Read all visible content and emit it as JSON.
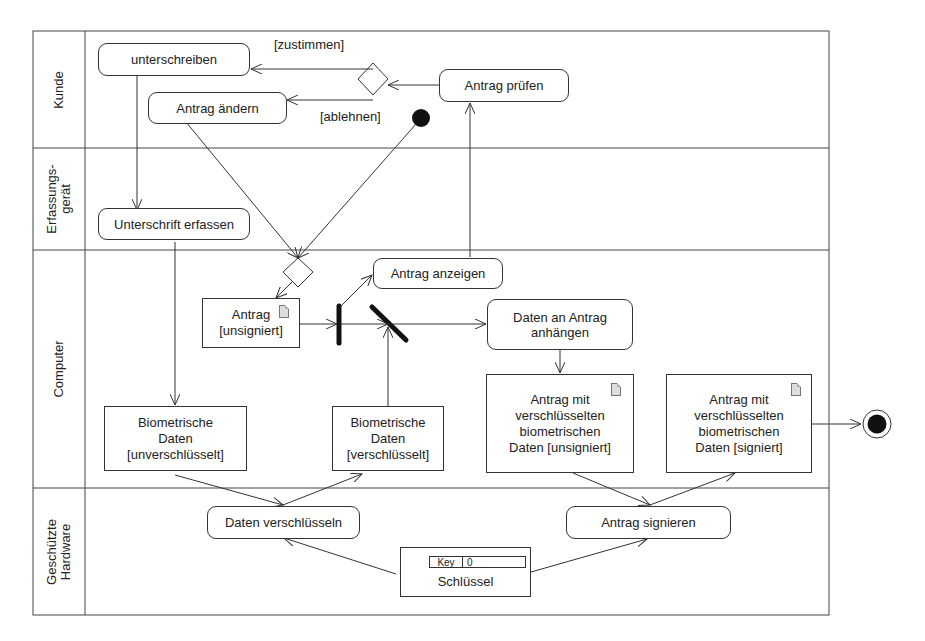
{
  "lanes": [
    {
      "label": "Kunde"
    },
    {
      "label_line1": "Erfassungs-",
      "label_line2": "gerät"
    },
    {
      "label": "Computer"
    },
    {
      "label_line1": "Geschützte",
      "label_line2": "Hardware"
    }
  ],
  "actions": {
    "unterschreiben": "unterschreiben",
    "antrag_aendern": "Antrag ändern",
    "antrag_pruefen": "Antrag prüfen",
    "unterschrift_erfassen": "Unterschrift erfassen",
    "antrag_anzeigen": "Antrag anzeigen",
    "daten_anhaengen": "Daten an Antrag anhängen",
    "daten_verschluesseln": "Daten verschlüsseln",
    "antrag_signieren": "Antrag signieren"
  },
  "objects": {
    "antrag_unsigniert": "Antrag\n[unsigniert]",
    "bio_unverschluesselt": "Biometrische\nDaten\n[unverschlüsselt]",
    "bio_verschluesselt": "Biometrische\nDaten\n[verschlüsselt]",
    "antrag_bio_unsigniert": "Antrag mit\nverschlüsselten\nbiometrischen\nDaten [unsigniert]",
    "antrag_bio_signiert": "Antrag mit\nverschlüsselten\nbiometrischen\nDaten [signiert]",
    "schluessel": "Schlüssel",
    "schluessel_key_label": "Key",
    "schluessel_key_value": "0"
  },
  "guards": {
    "zustimmen": "[zustimmen]",
    "ablehnen": "[ablehnen]"
  },
  "colors": {
    "line": "#333333",
    "node_fill": "#111111",
    "doc_icon": "#dddddd"
  }
}
